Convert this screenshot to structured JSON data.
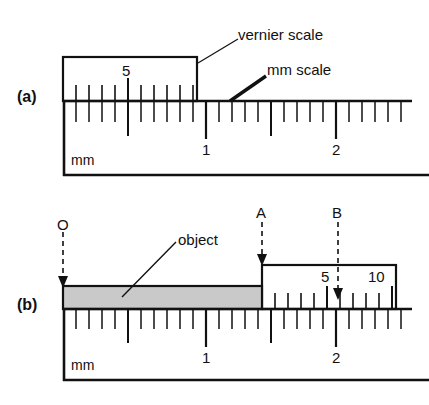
{
  "figure": {
    "type": "diagram",
    "width": 429,
    "height": 405,
    "background_color": "#ffffff",
    "line_color": "#111111",
    "object_fill_color": "#c9c9c9"
  },
  "panels": [
    {
      "id": "a",
      "label": "(a)",
      "caption": "Vernier scale at zero position over mm scale",
      "annotations": [
        {
          "name": "vernier-scale-label",
          "text": "vernier scale"
        },
        {
          "name": "mm-scale-label",
          "text": "mm scale"
        }
      ],
      "vernier": {
        "number_labels": [
          "5"
        ],
        "tick_count": 10,
        "zero_offset_mm": 0
      },
      "main_scale": {
        "unit_label": "mm",
        "major_labels": [
          "1",
          "2"
        ],
        "minor_ticks_per_mm": 10
      }
    },
    {
      "id": "b",
      "label": "(b)",
      "caption": "Vernier scale measuring an object",
      "annotations": [
        {
          "name": "object-label",
          "text": "object"
        },
        {
          "name": "point-o-label",
          "text": "O"
        },
        {
          "name": "point-a-label",
          "text": "A"
        },
        {
          "name": "point-b-label",
          "text": "B"
        }
      ],
      "vernier": {
        "number_labels": [
          "5",
          "10"
        ],
        "tick_count": 10
      },
      "main_scale": {
        "unit_label": "mm",
        "major_labels": [
          "1",
          "2"
        ],
        "minor_ticks_per_mm": 10
      },
      "object": {
        "name": "measured-object",
        "fill": "#c9c9c9",
        "start_point": "O",
        "end_point": "A"
      }
    }
  ],
  "markers": {
    "o": "O",
    "a": "A",
    "b": "B"
  },
  "labels": {
    "panel_a": "(a)",
    "panel_b": "(b)",
    "vernier_scale": "vernier scale",
    "mm_scale": "mm scale",
    "object": "object",
    "mm_a": "mm",
    "mm_b": "mm",
    "a_vernier_5": "5",
    "a_main_1": "1",
    "a_main_2": "2",
    "b_vernier_5": "5",
    "b_vernier_10": "10",
    "b_main_1": "1",
    "b_main_2": "2"
  }
}
